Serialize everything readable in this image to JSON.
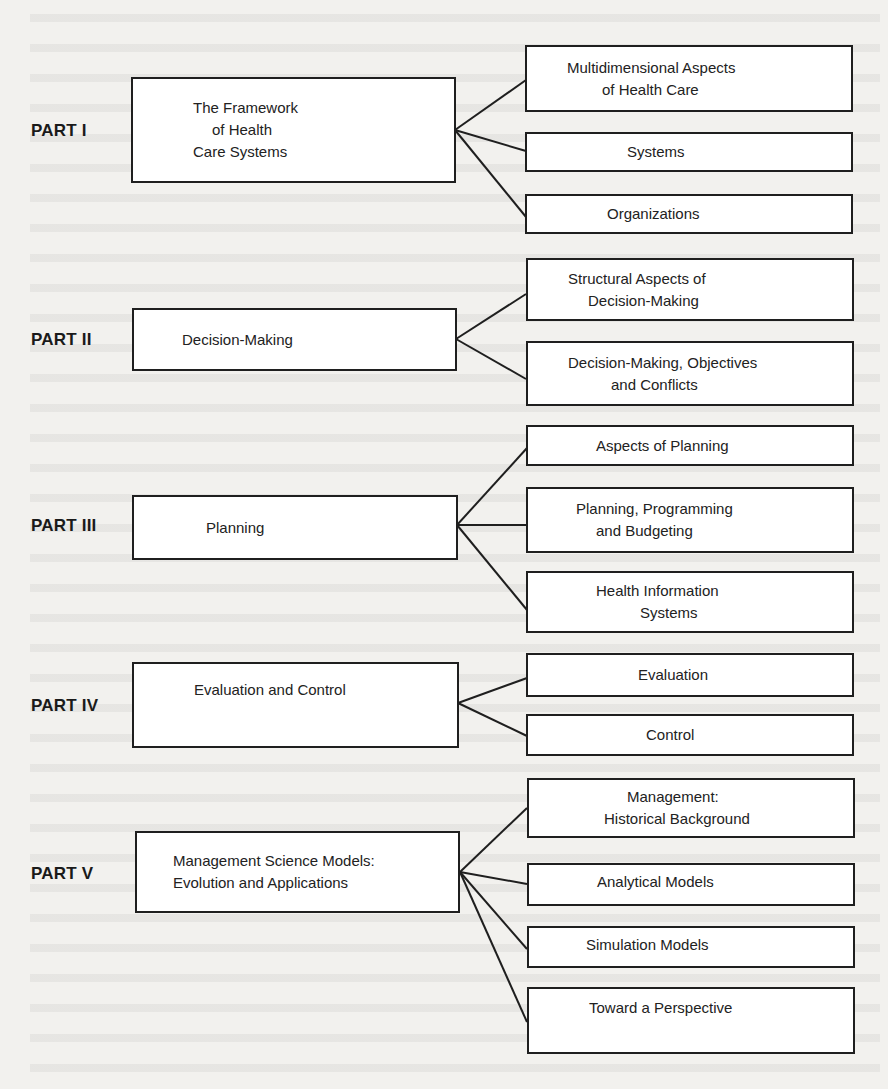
{
  "diagram": {
    "parts": [
      {
        "label": "PART I",
        "title_lines": [
          "The Framework",
          "of Health",
          "Care Systems"
        ],
        "children": [
          {
            "lines": [
              "Multidimensional Aspects",
              "of Health Care"
            ]
          },
          {
            "lines": [
              "Systems"
            ]
          },
          {
            "lines": [
              "Organizations"
            ]
          }
        ]
      },
      {
        "label": "PART II",
        "title_lines": [
          "Decision-Making"
        ],
        "children": [
          {
            "lines": [
              "Structural Aspects of",
              "Decision-Making"
            ]
          },
          {
            "lines": [
              "Decision-Making, Objectives",
              "and Conflicts"
            ]
          }
        ]
      },
      {
        "label": "PART III",
        "title_lines": [
          "Planning"
        ],
        "children": [
          {
            "lines": [
              "Aspects of Planning"
            ]
          },
          {
            "lines": [
              "Planning, Programming",
              "and Budgeting"
            ]
          },
          {
            "lines": [
              "Health Information",
              "Systems"
            ]
          }
        ]
      },
      {
        "label": "PART IV",
        "title_lines": [
          "Evaluation and Control"
        ],
        "children": [
          {
            "lines": [
              "Evaluation"
            ]
          },
          {
            "lines": [
              "Control"
            ]
          }
        ]
      },
      {
        "label": "PART V",
        "title_lines": [
          "Management Science Models:",
          "Evolution and Applications"
        ],
        "children": [
          {
            "lines": [
              "Management:",
              "Historical Background"
            ]
          },
          {
            "lines": [
              "Analytical Models"
            ]
          },
          {
            "lines": [
              "Simulation Models"
            ]
          },
          {
            "lines": [
              "Toward a Perspective"
            ]
          }
        ]
      }
    ],
    "colors": {
      "line": "#1f1f1f",
      "box_fill": "#ffffff",
      "paper": "#f2f1ee"
    }
  }
}
